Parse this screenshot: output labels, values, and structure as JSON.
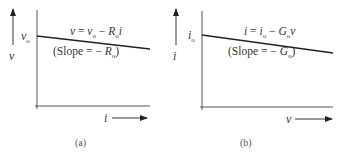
{
  "panels": [
    {
      "id": "a",
      "caption": "(a)",
      "y_axis_label": "v",
      "x_axis_label": "i",
      "intercept_label": "vo",
      "intercept_main": "v",
      "intercept_sub": "o",
      "equation": "v = vo − Ro i",
      "equation_parts": {
        "lhs": "v",
        "eq": " = ",
        "t1": "v",
        "t1_sub": "o",
        "minus": " − ",
        "t2": "R",
        "t2_sub": "o",
        "t3": "i"
      },
      "slope_text": "(Slope = − Ro)",
      "slope_parts": {
        "open": "(Slope = − ",
        "sym": "R",
        "sub": "o",
        "close": ")"
      }
    },
    {
      "id": "b",
      "caption": "(b)",
      "y_axis_label": "i",
      "x_axis_label": "v",
      "intercept_label": "io",
      "intercept_main": "i",
      "intercept_sub": "o",
      "equation": "i = io − Go v",
      "equation_parts": {
        "lhs": "i",
        "eq": " = ",
        "t1": "i",
        "t1_sub": "o",
        "minus": " − ",
        "t2": "G",
        "t2_sub": "o",
        "t3": "v"
      },
      "slope_text": "(Slope = − Go)",
      "slope_parts": {
        "open": "(Slope = − ",
        "sym": "G",
        "sub": "o",
        "close": ")"
      }
    }
  ],
  "colors": {
    "line": "#222222",
    "axis": "#444444",
    "text": "#333333"
  }
}
